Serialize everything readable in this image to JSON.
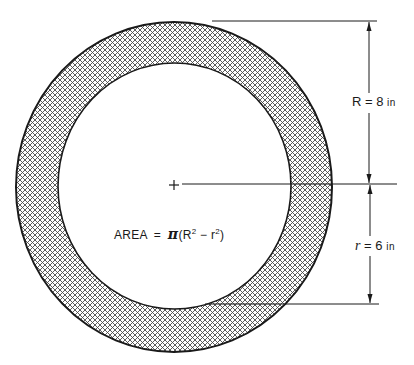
{
  "diagram": {
    "type": "annulus-area-dimension-drawing",
    "outer_radius": {
      "symbol": "R",
      "equals": "=",
      "value": "8",
      "unit": "in"
    },
    "inner_radius": {
      "symbol": "r",
      "equals": "=",
      "value": "6",
      "unit": "in"
    },
    "formula": {
      "label": "AREA",
      "equals": "=",
      "pi": "π",
      "open": "(R",
      "sup1": "2",
      "minus": " − r",
      "sup2": "2",
      "close": ")"
    },
    "center_marker": "+",
    "fill_pattern": "crosshatch",
    "colors": {
      "stroke": "#1a1a1a",
      "hatch": "#4a4a4a",
      "background": "#ffffff"
    }
  }
}
